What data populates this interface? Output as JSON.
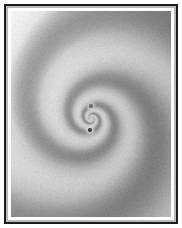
{
  "figure": {
    "title": "",
    "caption": "",
    "type": "grayscale-spiral-field",
    "width_px": 182,
    "height_px": 228,
    "frame": {
      "outer_margin_px": 4,
      "border_width_px": 2,
      "border_color": "#1c1c1c",
      "margin_color": "#ffffff",
      "inner_bevel_color": "#ffffff"
    }
  },
  "chart_data": {
    "type": "heatmap",
    "title": "",
    "subtitle": "",
    "xlabel": "",
    "ylabel": "",
    "grid": false,
    "legend": "none",
    "colormap": "gray",
    "value_min": 0.0,
    "value_max": 1.0,
    "gray_min_hex": "#4a4a4a",
    "gray_max_hex": "#f2f2f2",
    "field": {
      "model": "two-arm-log-spiral-phase",
      "arm_count": 2,
      "turns_visible": 2.5,
      "spiral_pitch_b": 0.33,
      "rotation_sense": "counter-clockwise",
      "phase_offset_deg": 0,
      "radial_falloff": 0.0,
      "background_gradient": {
        "direction": "top-left-bright-to-bottom-right-mid",
        "corner_top_left_hex": "#f4f4f4",
        "corner_top_right_hex": "#9a9a9a",
        "corner_bottom_left_hex": "#b5b5b5",
        "corner_bottom_right_hex": "#9c9c9c"
      }
    },
    "center": {
      "x_px": 89,
      "y_px": 116
    },
    "markers": [
      {
        "name": "upper-core-point",
        "x_px": 89,
        "y_px": 104,
        "radius_px": 1.6,
        "color": "#6e6e6e",
        "halo_color": "#c9c9c9",
        "label": ""
      },
      {
        "name": "lower-core-point",
        "x_px": 88,
        "y_px": 128,
        "radius_px": 1.8,
        "color": "#3a3a3a",
        "halo_color": "#d8d8d8",
        "label": ""
      }
    ],
    "axis_ranges": {
      "x": [
        -1.0,
        1.0
      ],
      "y": [
        -1.0,
        1.0
      ]
    },
    "tick_labels": {
      "x": [],
      "y": []
    },
    "annotations": []
  }
}
